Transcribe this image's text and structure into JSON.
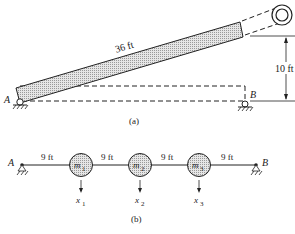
{
  "figure_a": {
    "length_label": "36 ft",
    "height_label": "10 ft",
    "point_a": "A",
    "point_b": "B",
    "caption": "(a)"
  },
  "figure_b": {
    "point_a": "A",
    "point_b": "B",
    "spans": [
      "9 ft",
      "9 ft",
      "9 ft",
      "9 ft"
    ],
    "masses": [
      {
        "label": "m",
        "sub": "1",
        "disp": "x",
        "disp_sub": "1"
      },
      {
        "label": "m",
        "sub": "2",
        "disp": "x",
        "disp_sub": "2"
      },
      {
        "label": "m",
        "sub": "3",
        "disp": "x",
        "disp_sub": "3"
      }
    ],
    "caption": "(b)"
  },
  "colors": {
    "ink": "#222222",
    "fill": "#d4d4d4"
  }
}
